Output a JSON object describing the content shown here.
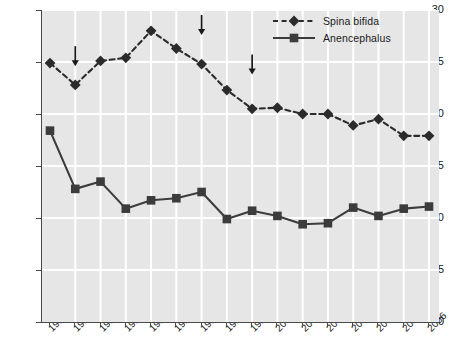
{
  "chart_data": {
    "type": "line",
    "title": "",
    "xlabel": "",
    "ylabel": "Rate per 1000 live births",
    "ylim": [
      0,
      30
    ],
    "yticks": [
      0,
      5,
      10,
      15,
      20,
      25,
      30
    ],
    "grid": true,
    "legend_position": "top-right",
    "categories": [
      "1991",
      "1992",
      "1993",
      "1994",
      "1995",
      "1996",
      "1997",
      "1998",
      "1999",
      "2000",
      "2001",
      "2002",
      "2003",
      "2004",
      "2005",
      "2006"
    ],
    "series": [
      {
        "name": "Spina bifida",
        "marker": "diamond",
        "linestyle": "dashed",
        "color": "#2b2b2b",
        "values": [
          24.9,
          22.8,
          25.1,
          25.4,
          28.0,
          26.3,
          24.8,
          22.3,
          20.5,
          20.6,
          20.0,
          20.0,
          18.9,
          19.5,
          17.9,
          17.9
        ]
      },
      {
        "name": "Anencephalus",
        "marker": "square",
        "linestyle": "solid",
        "color": "#3c3c3c",
        "values": [
          18.4,
          12.8,
          13.5,
          10.9,
          11.7,
          11.9,
          12.5,
          9.9,
          10.7,
          10.2,
          9.4,
          9.5,
          11.0,
          10.2,
          10.9,
          11.1
        ]
      }
    ],
    "annotations": [
      {
        "type": "arrow",
        "label": "",
        "x_category": "1992",
        "points_to_value": 24.6
      },
      {
        "type": "arrow",
        "label": "",
        "x_category": "1997",
        "points_to_value": 27.6
      },
      {
        "type": "arrow",
        "label": "",
        "x_category": "1999",
        "points_to_value": 23.8
      }
    ],
    "colors": {
      "plot_background": "#e6e6e6",
      "gridline": "#ffffff",
      "axis": "#4a4a4a",
      "text": "#1a1a1a"
    }
  }
}
